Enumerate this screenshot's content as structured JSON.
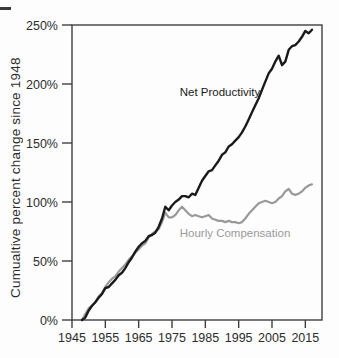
{
  "chart_data": {
    "type": "line",
    "title": "",
    "ylabel": "Cumualtive percent change since 1948",
    "xlabel": "",
    "grid": false,
    "legend_position": "inline-annotations",
    "xlim": [
      1945,
      2020
    ],
    "ylim": [
      0,
      250
    ],
    "x_ticks": [
      1945,
      1955,
      1965,
      1975,
      1985,
      1995,
      2005,
      2015
    ],
    "y_ticks": [
      {
        "value": 0,
        "label": "0%"
      },
      {
        "value": 50,
        "label": "50%"
      },
      {
        "value": 100,
        "label": "100%"
      },
      {
        "value": 150,
        "label": "150%"
      },
      {
        "value": 200,
        "label": "200%"
      },
      {
        "value": 250,
        "label": "250%"
      }
    ],
    "frame_color": "#3f3f3f",
    "x": [
      1948,
      1949,
      1950,
      1951,
      1952,
      1953,
      1954,
      1955,
      1956,
      1957,
      1958,
      1959,
      1960,
      1961,
      1962,
      1963,
      1964,
      1965,
      1966,
      1967,
      1968,
      1969,
      1970,
      1971,
      1972,
      1973,
      1974,
      1975,
      1976,
      1977,
      1978,
      1979,
      1980,
      1981,
      1982,
      1983,
      1984,
      1985,
      1986,
      1987,
      1988,
      1989,
      1990,
      1991,
      1992,
      1993,
      1994,
      1995,
      1996,
      1997,
      1998,
      1999,
      2000,
      2001,
      2002,
      2003,
      2004,
      2005,
      2006,
      2007,
      2008,
      2009,
      2010,
      2011,
      2012,
      2013,
      2014,
      2015,
      2016,
      2017
    ],
    "series": [
      {
        "name": "Net Productivity",
        "color": "#1a1a1a",
        "stroke_width": 2.4,
        "values": [
          0,
          2,
          8,
          12,
          15,
          19,
          22,
          27,
          28,
          31,
          34,
          38,
          40,
          44,
          49,
          53,
          58,
          62,
          65,
          67,
          71,
          72,
          74,
          79,
          86,
          96,
          93,
          97,
          100,
          102,
          105,
          105,
          104,
          107,
          106,
          112,
          118,
          122,
          126,
          127,
          131,
          135,
          140,
          142,
          147,
          149,
          152,
          155,
          159,
          164,
          170,
          176,
          182,
          188,
          195,
          202,
          209,
          213,
          219,
          224,
          216,
          219,
          229,
          232,
          233,
          236,
          240,
          245,
          243,
          246
        ]
      },
      {
        "name": "Hourly Compensation",
        "color": "#999999",
        "stroke_width": 2.2,
        "values": [
          0,
          5,
          10,
          12,
          15,
          20,
          23,
          28,
          32,
          35,
          37,
          41,
          44,
          47,
          51,
          54,
          57,
          60,
          63,
          65,
          70,
          73,
          75,
          77,
          83,
          91,
          87,
          87,
          89,
          93,
          96,
          93,
          90,
          88,
          89,
          88,
          87,
          88,
          89,
          86,
          85,
          84,
          84,
          83,
          84,
          83,
          83,
          82,
          83,
          86,
          90,
          93,
          96,
          99,
          100,
          101,
          100,
          99,
          100,
          103,
          105,
          109,
          111,
          107,
          106,
          107,
          109,
          112,
          114,
          115
        ]
      }
    ],
    "annotations": [
      {
        "text": "Net Productivity",
        "x": 1989.4,
        "y": 193,
        "color": "#1a1a1a",
        "font_size": 11.5
      },
      {
        "text": "Hourly Compensation",
        "x": 1993.9,
        "y": 74,
        "color": "#9a9a9a",
        "font_size": 11.5
      }
    ]
  }
}
